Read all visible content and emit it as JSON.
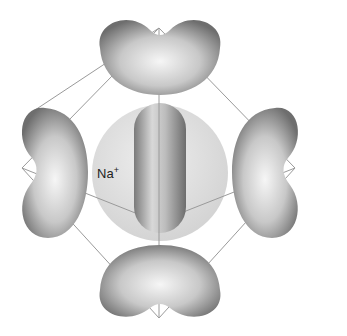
{
  "diagram": {
    "center_label": "Na",
    "center_charge": "+",
    "lobes": [
      {
        "name": "top",
        "cx": 159,
        "cy": 55
      },
      {
        "name": "bottom",
        "cx": 159,
        "cy": 278
      },
      {
        "name": "left",
        "cx": 52,
        "cy": 172
      },
      {
        "name": "right",
        "cx": 267,
        "cy": 172
      },
      {
        "name": "front-center",
        "cx": 159,
        "cy": 170
      }
    ],
    "colors": {
      "lobe_dark": "#6f6f6f",
      "lobe_light": "#f4f4f4",
      "sphere": "#d9d9d9",
      "edges": "#9a9a9a"
    }
  }
}
